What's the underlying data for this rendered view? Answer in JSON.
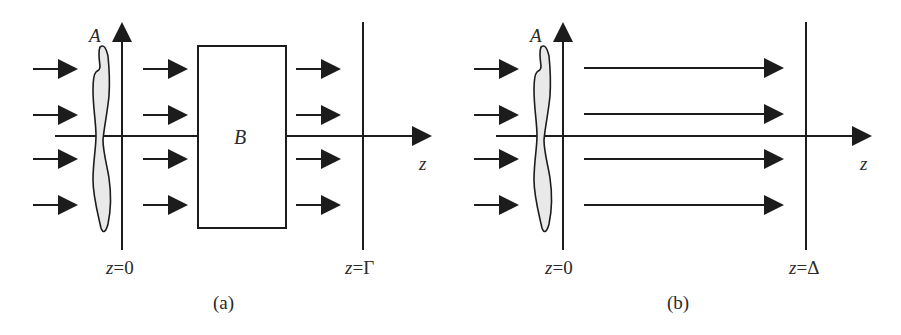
{
  "figure": {
    "panels": [
      {
        "id": "a",
        "caption": "(a)",
        "object_label": "A",
        "element_label": "B",
        "axis_label": "z",
        "origin_label": {
          "var": "z",
          "eq": "=",
          "val": "0"
        },
        "plane_label": {
          "var": "z",
          "eq": "=",
          "val": "Γ"
        },
        "incident_arrows": 4,
        "arrows_after_object": 4,
        "arrows_after_element": 4
      },
      {
        "id": "b",
        "caption": "(b)",
        "object_label": "A",
        "axis_label": "z",
        "origin_label": {
          "var": "z",
          "eq": "=",
          "val": "0"
        },
        "plane_label": {
          "var": "z",
          "eq": "=",
          "val": "Δ"
        },
        "incident_arrows": 4,
        "propagating_arrows": 4
      }
    ],
    "colors": {
      "ink": "#1c1c1c",
      "object_fill": "#e9e9e9",
      "background": "#ffffff"
    }
  }
}
